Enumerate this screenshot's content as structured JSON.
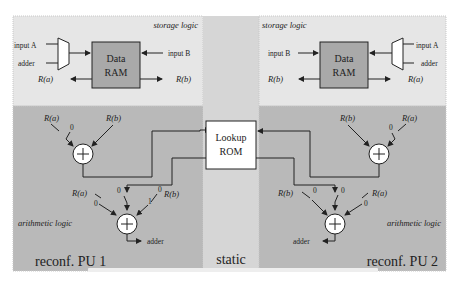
{
  "diagram": {
    "colors": {
      "storage_bg": "#e6e6e6",
      "arith_bg": "#b9b9b9",
      "static_bg": "#d6d6d6",
      "ram_fill": "#a9a9a9",
      "rom_fill": "#ffffff",
      "line": "#222222"
    },
    "left": {
      "storage_title": "storage logic",
      "mux_inputs": [
        "input A",
        "adder"
      ],
      "ram_line1": "Data",
      "ram_line2": "RAM",
      "input_b": "input B",
      "out_a": "R(a)",
      "out_b": "R(b)",
      "adder1": {
        "in_a": "R(a)",
        "zero": "0",
        "in_b": "R(b)"
      },
      "adder2": {
        "in_a": "R(a)",
        "zero_a": "0",
        "zero_mid": "0",
        "zero_b": "0",
        "one": "1",
        "in_b": "R(b)",
        "out": "adder"
      },
      "arith_title": "arithmetic logic",
      "pu_label": "reconf. PU 1"
    },
    "center": {
      "rom_line1": "Lookup",
      "rom_line2": "ROM",
      "static_label": "static"
    },
    "right": {
      "storage_title": "storage logic",
      "mux_inputs": [
        "input A",
        "adder"
      ],
      "ram_line1": "Data",
      "ram_line2": "RAM",
      "input_b": "input B",
      "out_a": "R(a)",
      "out_b": "R(b)",
      "adder1": {
        "in_b": "R(b)",
        "zero": "0",
        "in_a": "R(a)"
      },
      "adder2": {
        "in_b": "R(b)",
        "zero_b": "0",
        "zero_mid": "0",
        "zero_a": "0",
        "in_a": "R(a)",
        "out": "adder"
      },
      "arith_title": "arithmetic logic",
      "pu_label": "reconf. PU 2"
    }
  }
}
